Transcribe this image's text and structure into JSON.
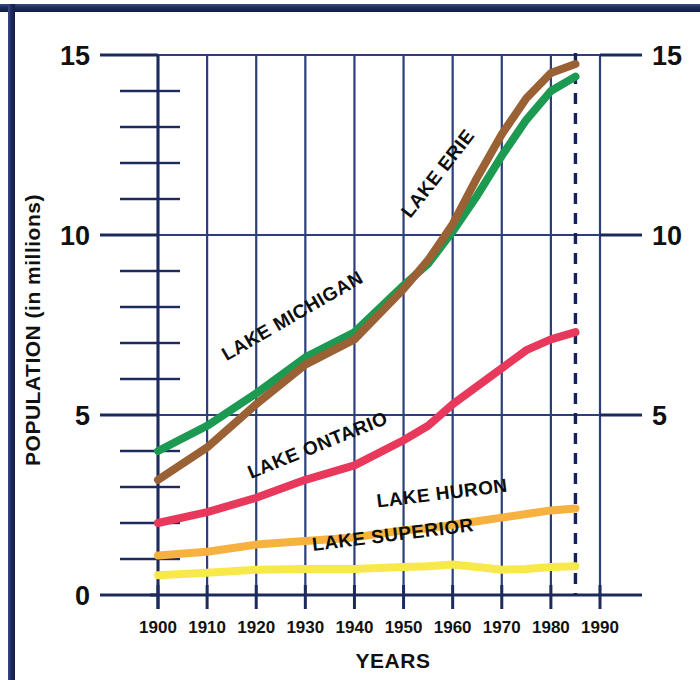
{
  "chart_data": {
    "type": "line",
    "title": "",
    "xlabel": "YEARS",
    "ylabel": "POPULATION (in millions)",
    "xlim": [
      1900,
      1990
    ],
    "ylim": [
      0,
      15
    ],
    "x_ticks": [
      "1900",
      "1910",
      "1920",
      "1930",
      "1940",
      "1950",
      "1960",
      "1970",
      "1980",
      "1990"
    ],
    "y_ticks_major": [
      "0",
      "5",
      "10",
      "15"
    ],
    "y_ticks_major_right": [
      "5",
      "10",
      "15"
    ],
    "y_minor_step": 1,
    "grid": true,
    "legend_position": "inline-labels",
    "data_cutoff_year": 1985,
    "data_cutoff_style": "dashed vertical line",
    "series": [
      {
        "name": "LAKE ERIE",
        "color": "#9a6134",
        "label_x": 1958,
        "label_y": 11.6,
        "x": [
          1900,
          1910,
          1920,
          1930,
          1940,
          1950,
          1955,
          1960,
          1965,
          1970,
          1975,
          1980,
          1985
        ],
        "values": [
          3.2,
          4.1,
          5.3,
          6.4,
          7.1,
          8.5,
          9.3,
          10.3,
          11.6,
          12.8,
          13.8,
          14.5,
          14.75
        ]
      },
      {
        "name": "LAKE MICHIGAN",
        "color": "#1c9a52",
        "label_x": 1928,
        "label_y": 7.6,
        "x": [
          1900,
          1910,
          1920,
          1930,
          1940,
          1950,
          1955,
          1960,
          1965,
          1970,
          1975,
          1980,
          1985
        ],
        "values": [
          4.0,
          4.7,
          5.6,
          6.6,
          7.3,
          8.6,
          9.2,
          10.1,
          11.1,
          12.2,
          13.2,
          14.0,
          14.4
        ]
      },
      {
        "name": "LAKE ONTARIO",
        "color": "#e8385c",
        "label_x": 1933,
        "label_y": 4.0,
        "x": [
          1900,
          1910,
          1920,
          1930,
          1940,
          1950,
          1955,
          1960,
          1965,
          1970,
          1975,
          1980,
          1985
        ],
        "values": [
          2.0,
          2.3,
          2.7,
          3.2,
          3.6,
          4.3,
          4.7,
          5.3,
          5.8,
          6.3,
          6.8,
          7.1,
          7.3
        ]
      },
      {
        "name": "LAKE HURON",
        "color": "#f6b13f",
        "label_x": 1958,
        "label_y": 2.65,
        "x": [
          1900,
          1910,
          1920,
          1930,
          1940,
          1950,
          1955,
          1960,
          1965,
          1970,
          1975,
          1980,
          1985
        ],
        "values": [
          1.1,
          1.2,
          1.4,
          1.5,
          1.6,
          1.8,
          1.85,
          1.95,
          2.05,
          2.15,
          2.25,
          2.35,
          2.4
        ]
      },
      {
        "name": "LAKE SUPERIOR",
        "color": "#f7e94a",
        "label_x": 1948,
        "label_y": 1.5,
        "x": [
          1900,
          1910,
          1920,
          1930,
          1940,
          1950,
          1955,
          1960,
          1965,
          1970,
          1975,
          1980,
          1985
        ],
        "values": [
          0.55,
          0.62,
          0.7,
          0.72,
          0.72,
          0.78,
          0.8,
          0.85,
          0.78,
          0.7,
          0.72,
          0.78,
          0.8
        ]
      }
    ]
  },
  "axes": {
    "x_title": "YEARS",
    "y_title": "POPULATION (in millions)"
  },
  "colors": {
    "frame": "#1d2a5e",
    "grid": "#2b3f7a",
    "axis": "#1d2a5e"
  }
}
